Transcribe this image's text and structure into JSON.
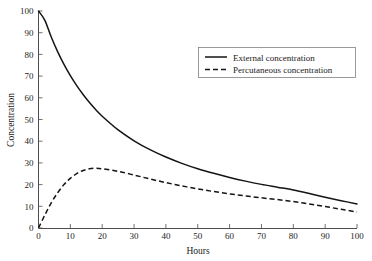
{
  "chart_data": {
    "type": "line",
    "title": "",
    "xlabel": "Hours",
    "ylabel": "Concentration",
    "xlim": [
      0,
      100
    ],
    "ylim": [
      0,
      100
    ],
    "xticks": [
      0,
      10,
      20,
      30,
      40,
      50,
      60,
      70,
      80,
      90,
      100
    ],
    "yticks": [
      0,
      10,
      20,
      30,
      40,
      50,
      60,
      70,
      80,
      90,
      100
    ],
    "grid": false,
    "legend_position": "upper right",
    "x": [
      0,
      2,
      4,
      6,
      8,
      10,
      12,
      14,
      16,
      18,
      20,
      25,
      30,
      35,
      40,
      45,
      50,
      55,
      60,
      65,
      70,
      75,
      80,
      85,
      90,
      95,
      100
    ],
    "series": [
      {
        "name": "External concentration",
        "style": "solid",
        "color": "#141414",
        "values": [
          100.0,
          95.7,
          88.0,
          81.3,
          75.4,
          70.2,
          65.6,
          61.5,
          57.8,
          54.5,
          51.5,
          45.2,
          40.2,
          36.1,
          32.7,
          29.8,
          27.3,
          25.2,
          23.3,
          21.6,
          20.1,
          18.8,
          17.5,
          15.9,
          14.2,
          12.6,
          11.1
        ]
      },
      {
        "name": "Percutaneous concentration",
        "style": "dashed",
        "color": "#141414",
        "values": [
          0.0,
          6.0,
          11.6,
          16.2,
          20.0,
          22.9,
          25.1,
          26.5,
          27.3,
          27.5,
          27.3,
          26.1,
          24.4,
          22.6,
          20.9,
          19.4,
          18.0,
          16.8,
          15.7,
          14.8,
          13.9,
          13.1,
          12.2,
          11.1,
          9.9,
          8.6,
          7.4
        ]
      }
    ],
    "legend": [
      {
        "label": "External concentration",
        "style": "solid"
      },
      {
        "label": "Percutaneous concentration",
        "style": "dashed"
      }
    ]
  },
  "axes": {
    "x_tick_labels": [
      "0",
      "10",
      "20",
      "30",
      "40",
      "50",
      "60",
      "70",
      "80",
      "90",
      "100"
    ],
    "y_tick_labels": [
      "0",
      "10",
      "20",
      "30",
      "40",
      "50",
      "60",
      "70",
      "80",
      "90",
      "100"
    ],
    "x_axis_title": "Hours",
    "y_axis_title": "Concentration"
  },
  "colors": {
    "background": "#ffffff",
    "axis": "#4d4d4d",
    "line": "#141414",
    "legend_border": "#808080",
    "text": "#1a1a1a"
  }
}
